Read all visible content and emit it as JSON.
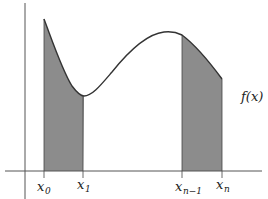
{
  "diagram": {
    "type": "riemann-endpoint-regions",
    "curve_label": "f(x)",
    "colors": {
      "shade": "#8c8c8c",
      "curve": "#333333",
      "axis": "#555555",
      "background": "#ffffff"
    },
    "ticks": [
      {
        "base": "x",
        "sub": "0",
        "px": 44
      },
      {
        "base": "x",
        "sub": "1",
        "px": 83
      },
      {
        "base": "x",
        "sub": "n−1",
        "px": 182
      },
      {
        "base": "x",
        "sub": "n",
        "px": 222
      }
    ],
    "shaded_regions": [
      {
        "from": "x0",
        "to": "x1"
      },
      {
        "from": "xn-1",
        "to": "xn"
      }
    ]
  }
}
